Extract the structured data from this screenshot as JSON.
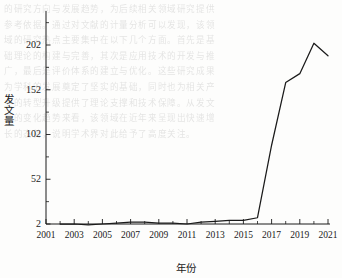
{
  "chart_data": {
    "type": "line",
    "title": "",
    "xlabel": "年份",
    "ylabel": "发文量",
    "x": [
      2002,
      2003,
      2004,
      2005,
      2006,
      2007,
      2008,
      2009,
      2010,
      2011,
      2012,
      2013,
      2014,
      2015,
      2016,
      2017,
      2018,
      2019,
      2020,
      2021
    ],
    "values": [
      2,
      2,
      1,
      2,
      3,
      4,
      4,
      3,
      3,
      2,
      4,
      5,
      6,
      6,
      9,
      90,
      160,
      170,
      204,
      190
    ],
    "series": [
      {
        "name": "发文量",
        "values": [
          2,
          2,
          1,
          2,
          3,
          4,
          4,
          3,
          3,
          2,
          4,
          5,
          6,
          6,
          9,
          90,
          160,
          170,
          204,
          190
        ]
      }
    ],
    "xlim": [
      2001,
      2021
    ],
    "ylim": [
      2,
      224
    ],
    "xticks": [
      2001,
      2003,
      2005,
      2007,
      2009,
      2011,
      2013,
      2015,
      2017,
      2019,
      2021
    ],
    "xticklabels": [
      "2001",
      "2003",
      "2005",
      "2007",
      "2009",
      "2011",
      "2013",
      "2015",
      "2017",
      "2019",
      "2021"
    ],
    "xticks_minor": [
      2002,
      2004,
      2006,
      2008,
      2010,
      2012,
      2014,
      2016,
      2018,
      2020
    ],
    "yticks": [
      2,
      52,
      102,
      152,
      202
    ],
    "yticklabels": [
      "2",
      "52",
      "102",
      "152",
      "202"
    ],
    "grid": false,
    "legend": null,
    "line_color": "#1a1a1a",
    "axis_color": "#1a1a1a",
    "background_color": "#fdfdfc"
  },
  "axis": {
    "y_title": "发文量",
    "x_title": "年份"
  },
  "background_text": {
    "lines": [
      "的研究方向与发展趋势，为后续相关领域研究提供",
      "参考依据。通过对文献的计量分析可以发现，该领",
      "域的研究热点主要集中在以下几个方面。首先是基",
      "础理论的构建与完善，其次是应用技术的开发与推",
      "广，最后是评价体系的建立与优化。这些研究成果",
      "为学科的发展奠定了坚实的基础，同时也为相关产",
      "业的转型升级提供了理论支撑和技术保障。从发文",
      "量的变化趋势来看，该领域在近年来呈现出快速增",
      "长的态势，说明学术界对此给予了高度关注。"
    ]
  }
}
